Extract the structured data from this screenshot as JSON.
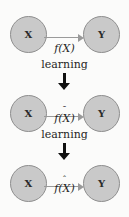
{
  "diagram": {
    "node_source_label": "X",
    "node_target_label": "Y",
    "colors": {
      "node_fill": "#c9c9c9",
      "node_stroke": "#8e8e8e",
      "edge_arrow": "#9a9a9a",
      "step_arrow": "#111111",
      "text": "#1f1f1f",
      "background": "#fbfbfa"
    },
    "rows": [
      {
        "source": "X",
        "target": "Y",
        "edge_label_base": "f(X)",
        "edge_label_accent": "",
        "edge_label_full": "f(X)"
      },
      {
        "source": "X",
        "target": "Y",
        "edge_label_base": "f(X)",
        "edge_label_accent": "ˉ",
        "edge_label_full": "f̄(X)"
      },
      {
        "source": "X",
        "target": "Y",
        "edge_label_base": "f(X)",
        "edge_label_accent": "ˆ",
        "edge_label_full": "f̂(X)"
      }
    ],
    "steps": [
      {
        "label": "learning",
        "arrow": "down-arrow"
      },
      {
        "label": "learning",
        "arrow": "down-arrow"
      }
    ]
  }
}
